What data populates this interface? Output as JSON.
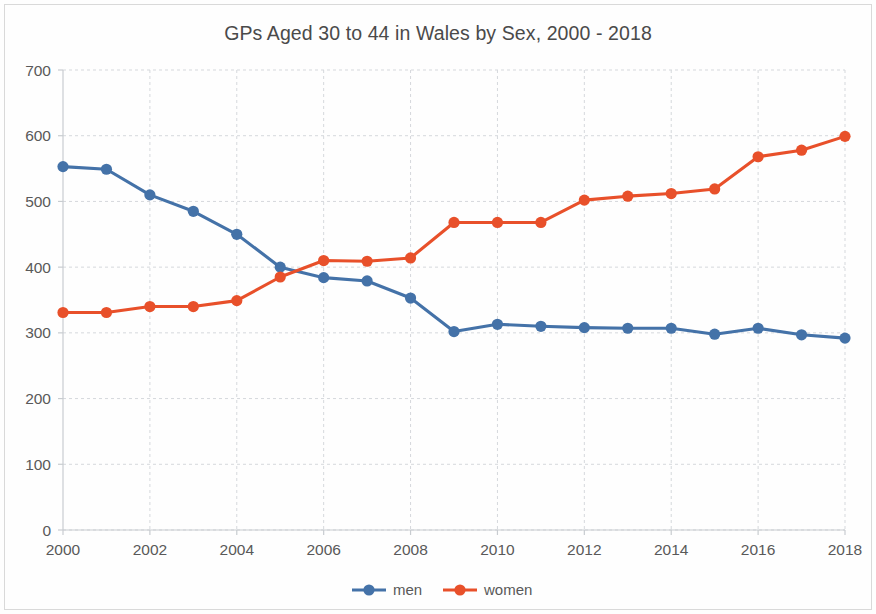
{
  "chart_data": {
    "type": "line",
    "title": "GPs Aged 30 to 44 in Wales by Sex, 2000 - 2018",
    "xlabel": "",
    "ylabel": "",
    "x": [
      2000,
      2001,
      2002,
      2003,
      2004,
      2005,
      2006,
      2007,
      2008,
      2009,
      2010,
      2011,
      2012,
      2013,
      2014,
      2015,
      2016,
      2017,
      2018
    ],
    "xtick_labels": [
      "2000",
      "2002",
      "2004",
      "2006",
      "2008",
      "2010",
      "2012",
      "2014",
      "2016",
      "2018"
    ],
    "xticks": [
      2000,
      2002,
      2004,
      2006,
      2008,
      2010,
      2012,
      2014,
      2016,
      2018
    ],
    "ytick_labels": [
      "0",
      "100",
      "200",
      "300",
      "400",
      "500",
      "600",
      "700"
    ],
    "yticks": [
      0,
      100,
      200,
      300,
      400,
      500,
      600,
      700
    ],
    "ylim": [
      0,
      700
    ],
    "xlim": [
      2000,
      2018
    ],
    "grid": true,
    "legend_position": "bottom",
    "series": [
      {
        "name": "men",
        "color": "#4472A8",
        "marker": "circle",
        "values": [
          553,
          549,
          510,
          485,
          450,
          400,
          384,
          379,
          353,
          302,
          313,
          310,
          308,
          307,
          307,
          298,
          307,
          297,
          292
        ]
      },
      {
        "name": "women",
        "color": "#E8502A",
        "marker": "circle",
        "values": [
          331,
          331,
          340,
          340,
          349,
          385,
          410,
          409,
          414,
          468,
          468,
          468,
          502,
          508,
          512,
          519,
          568,
          578,
          599
        ]
      }
    ]
  },
  "legend": {
    "entries": [
      {
        "label": "men",
        "color": "#4472A8"
      },
      {
        "label": "women",
        "color": "#E8502A"
      }
    ]
  }
}
